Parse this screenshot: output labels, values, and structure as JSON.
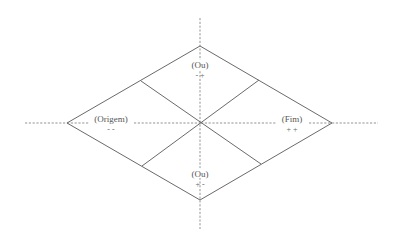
{
  "diagram": {
    "type": "rhombus-quadrant",
    "colors": {
      "edge": "#6a6a6a",
      "axis": "#7a7a7a",
      "text": "#555555",
      "background": "#ffffff"
    },
    "regions": {
      "top": {
        "label": "(Ou)",
        "signs": "- +"
      },
      "left": {
        "label": "(Origem)",
        "signs": "- -"
      },
      "right": {
        "label": "(Fim)",
        "signs": "+ +"
      },
      "bottom": {
        "label": "(Ou)",
        "signs": "+ -"
      }
    }
  }
}
